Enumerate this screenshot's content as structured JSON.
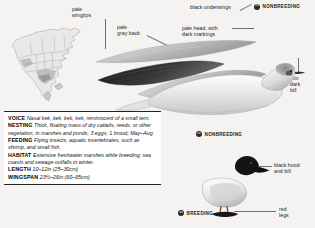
{
  "page": {
    "species_guide": "bird-field-guide-entry"
  },
  "callouts": [
    {
      "id": "pale-wingtips",
      "lines": [
        "pale",
        "wingtips"
      ]
    },
    {
      "id": "pale-gray-back",
      "lines": [
        "pale",
        "gray back"
      ]
    },
    {
      "id": "black-underwings",
      "lines": [
        "black underwings"
      ]
    },
    {
      "id": "pale-head",
      "lines": [
        "pale head, with",
        "dark markings"
      ]
    },
    {
      "id": "thin-dark-bill",
      "lines": [
        "thin",
        "dark",
        "bill"
      ]
    },
    {
      "id": "black-hood",
      "lines": [
        "black hood",
        "and bill"
      ]
    },
    {
      "id": "red-legs",
      "lines": [
        "red",
        "legs"
      ]
    }
  ],
  "badges": {
    "nonbreeding_top": "NONBREEDING",
    "nonbreeding_mid": "NONBREEDING",
    "breeding": "BREEDING"
  },
  "info": {
    "entries": [
      {
        "term": "VOICE",
        "text": "Nasal kek, kek, kek, kek, reminiscent of a small tern."
      },
      {
        "term": "NESTING",
        "text": "Thick, floating mass of dry cattails, reeds, or other vegetation, in marshes and ponds; 3 eggs; 1 brood; May–Aug."
      },
      {
        "term": "FEEDING",
        "text": "Flying insects, aquatic invertebrates, such as shrimp, and small fish."
      },
      {
        "term": "HABITAT",
        "text": "Extensive freshwater marshes while breeding; sea coasts and sewage outfalls in winter."
      }
    ],
    "measurements": [
      {
        "term": "LENGTH",
        "value": "10–12in (25–30cm)"
      },
      {
        "term": "WINGSPAN",
        "value": "23½–26in (60–65cm)"
      }
    ]
  },
  "colors": {
    "page_bg": "#f4f3f1",
    "text": "#1b1b1b",
    "rule": "#232323",
    "badge_dot": "#2a2a2a",
    "leader": "#6e6e6e"
  }
}
